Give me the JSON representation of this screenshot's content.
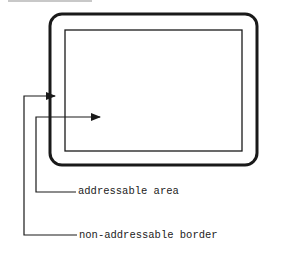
{
  "diagram": {
    "labels": {
      "addressable_area": "addressable area",
      "non_addressable_border": "non-addressable border"
    },
    "colors": {
      "stroke": "#1a1a1a",
      "text": "#222222",
      "background": "#ffffff"
    }
  }
}
